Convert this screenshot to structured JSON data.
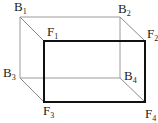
{
  "diagram": {
    "type": "cuboid",
    "back_face": {
      "vertices": [
        {
          "name": "B1",
          "letter": "B",
          "index": "1",
          "x": 20,
          "y": 17
        },
        {
          "name": "B2",
          "letter": "B",
          "index": "2",
          "x": 120,
          "y": 17
        },
        {
          "name": "B3",
          "letter": "B",
          "index": "3",
          "x": 20,
          "y": 78
        },
        {
          "name": "B4",
          "letter": "B",
          "index": "4",
          "x": 120,
          "y": 78
        }
      ],
      "stroke": "#9a9a9a"
    },
    "front_face": {
      "vertices": [
        {
          "name": "F1",
          "letter": "F",
          "index": "1",
          "x": 44,
          "y": 41
        },
        {
          "name": "F2",
          "letter": "F",
          "index": "2",
          "x": 145,
          "y": 41
        },
        {
          "name": "F3",
          "letter": "F",
          "index": "3",
          "x": 44,
          "y": 102
        },
        {
          "name": "F4",
          "letter": "F",
          "index": "4",
          "x": 145,
          "y": 102
        }
      ],
      "stroke": "#111111"
    },
    "connector_stroke": "#8a8a8a",
    "labels": {
      "B1": {
        "letter": "B",
        "index": "1"
      },
      "B2": {
        "letter": "B",
        "index": "2"
      },
      "B3": {
        "letter": "B",
        "index": "3"
      },
      "B4": {
        "letter": "B",
        "index": "4"
      },
      "F1": {
        "letter": "F",
        "index": "1"
      },
      "F2": {
        "letter": "F",
        "index": "2"
      },
      "F3": {
        "letter": "F",
        "index": "3"
      },
      "F4": {
        "letter": "F",
        "index": "4"
      }
    }
  }
}
